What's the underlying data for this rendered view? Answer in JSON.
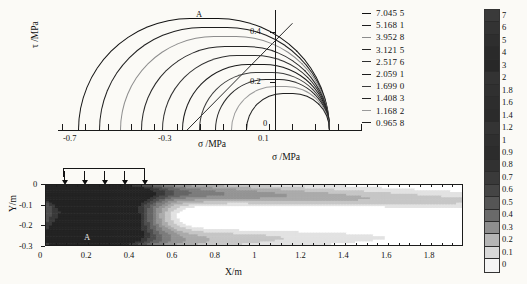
{
  "figure": {
    "caption_symbols": {
      "sigma": "σ",
      "tau": "τ"
    }
  },
  "mohr_panel": {
    "name": "mohr-circle-diagram",
    "ylabel": "τ /MPa",
    "xlabel": "σ /MPa",
    "point_label": "A",
    "x_ticks": [
      "-0.7",
      "-0.3",
      "0.1"
    ],
    "y_ticks": [
      "0.4",
      "0.2",
      "0"
    ],
    "legend_title": "",
    "legend_entries": [
      {
        "dash": "–",
        "value": "7.045 5"
      },
      {
        "dash": "–",
        "value": "5.168 1"
      },
      {
        "dash": "–",
        "value": "3.952 8"
      },
      {
        "dash": "–",
        "value": "3.121 5"
      },
      {
        "dash": "–",
        "value": "2.517 6"
      },
      {
        "dash": "–",
        "value": "2.059 1"
      },
      {
        "dash": "–",
        "value": "1.699 0"
      },
      {
        "dash": "–",
        "value": "1.408 3"
      },
      {
        "dash": "–",
        "value": "1.168 2"
      },
      {
        "dash": "–",
        "value": "0.965 8"
      }
    ]
  },
  "contour_panel": {
    "name": "stress-contour-map",
    "title": "σ /MPa",
    "xlabel": "X/m",
    "ylabel": "Y/m",
    "point_label": "A",
    "x_ticks": [
      "0",
      "0.2",
      "0.4",
      "0.6",
      "0.8",
      "1",
      "1.2",
      "1.4",
      "1.6",
      "1.8"
    ],
    "y_ticks": [
      "0",
      "-0.1",
      "-0.2",
      "-0.3"
    ],
    "load_arrows": 5
  },
  "colorbar": {
    "name": "shared-colorbar",
    "labels": [
      "7",
      "6",
      "5",
      "4",
      "3",
      "2",
      "1.8",
      "1.6",
      "1.4",
      "1.2",
      "1",
      "0.9",
      "0.8",
      "0.7",
      "0.6",
      "0.5",
      "0.4",
      "0.3",
      "0.2",
      "0.1",
      "0"
    ],
    "colors": [
      "#3a3a3a",
      "#333333",
      "#2e2e2e",
      "#2a2a2a",
      "#282828",
      "#333333",
      "#303030",
      "#2d2d2d",
      "#2b2b2b",
      "#343434",
      "#2f2f2f",
      "#2c2c2c",
      "#313131",
      "#3a3a3a",
      "#454545",
      "#555555",
      "#6a6a6a",
      "#8e8e8e",
      "#b5b5b5",
      "#d8d8d8",
      "#f4f4f4"
    ]
  },
  "chart_data": [
    {
      "type": "line",
      "name": "mohr-circles",
      "title": "",
      "xlabel": "σ /MPa",
      "ylabel": "τ /MPa",
      "xlim": [
        -0.82,
        0.3
      ],
      "ylim": [
        0,
        0.52
      ],
      "xticks": [
        -0.7,
        -0.3,
        0.1
      ],
      "yticks": [
        0,
        0.2,
        0.4
      ],
      "grid": false,
      "legend_position": "right",
      "legend": [
        "7.045 5",
        "5.168 1",
        "3.952 8",
        "3.121 5",
        "2.517 6",
        "2.059 1",
        "1.699 0",
        "1.408 3",
        "1.168 2",
        "0.965 8"
      ],
      "annotations": [
        {
          "text": "A",
          "x": -0.19,
          "y": 0.5
        }
      ],
      "series": [
        {
          "name": "7.045 5",
          "sigma_min": -0.76,
          "sigma_max": 0.198,
          "center": -0.281,
          "radius": 0.479
        },
        {
          "name": "5.168 1",
          "sigma_min": -0.68,
          "sigma_max": 0.198,
          "center": -0.241,
          "radius": 0.439
        },
        {
          "name": "3.952 8",
          "sigma_min": -0.6,
          "sigma_max": 0.198,
          "center": -0.201,
          "radius": 0.399
        },
        {
          "name": "3.121 5",
          "sigma_min": -0.52,
          "sigma_max": 0.198,
          "center": -0.161,
          "radius": 0.359
        },
        {
          "name": "2.517 6",
          "sigma_min": -0.44,
          "sigma_max": 0.198,
          "center": -0.121,
          "radius": 0.319
        },
        {
          "name": "2.059 1",
          "sigma_min": -0.365,
          "sigma_max": 0.198,
          "center": -0.084,
          "radius": 0.281
        },
        {
          "name": "1.699 0",
          "sigma_min": -0.3,
          "sigma_max": 0.198,
          "center": -0.051,
          "radius": 0.249
        },
        {
          "name": "1.408 3",
          "sigma_min": -0.24,
          "sigma_max": 0.198,
          "center": -0.021,
          "radius": 0.219
        },
        {
          "name": "1.168 2",
          "sigma_min": -0.18,
          "sigma_max": 0.198,
          "center": 0.009,
          "radius": 0.189
        },
        {
          "name": "0.965 8",
          "sigma_min": -0.12,
          "sigma_max": 0.198,
          "center": 0.039,
          "radius": 0.159
        }
      ],
      "failure_envelope": {
        "x_start": -0.345,
        "y_start": 0.0,
        "x_end": 0.055,
        "y_end": 0.455
      }
    },
    {
      "type": "heatmap",
      "name": "sigma-contour",
      "title": "σ /MPa",
      "xlabel": "X/m",
      "ylabel": "Y/m",
      "xlim": [
        0,
        1.95
      ],
      "ylim": [
        -0.3,
        0
      ],
      "xticks": [
        0,
        0.2,
        0.4,
        0.6,
        0.8,
        1.0,
        1.2,
        1.4,
        1.6,
        1.8
      ],
      "yticks": [
        0,
        -0.1,
        -0.2,
        -0.3
      ],
      "zrange": [
        0,
        0.9
      ],
      "levels": [
        0,
        0.1,
        0.2,
        0.3,
        0.4,
        0.5,
        0.6,
        0.7,
        0.8,
        0.9
      ],
      "colorbar_labels": [
        "0",
        "0.1",
        "0.2",
        "0.3",
        "0.4",
        "0.5",
        "0.6",
        "0.7",
        "0.8",
        "0.9"
      ],
      "annotations": [
        {
          "text": "A",
          "x": 0.19,
          "y": -0.245
        }
      ],
      "load": {
        "arrows": 5,
        "x_start": 0.06,
        "x_end": 0.26,
        "direction": "down"
      }
    }
  ]
}
